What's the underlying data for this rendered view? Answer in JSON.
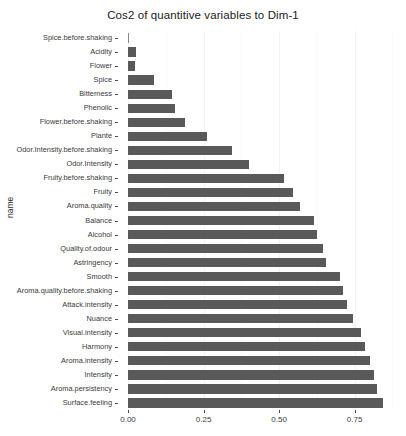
{
  "chart_data": {
    "type": "bar",
    "orientation": "horizontal",
    "title": "Cos2 of quantitive variables to Dim-1",
    "xlabel": "",
    "ylabel": "name",
    "xlim": [
      0,
      0.9
    ],
    "grid": true,
    "legend": "none",
    "bar_color": "#595959",
    "xticks": [
      {
        "value": 0,
        "label": "0.00"
      },
      {
        "value": 0.25,
        "label": "0.25"
      },
      {
        "value": 0.5,
        "label": "0.50"
      },
      {
        "value": 0.75,
        "label": "0.75"
      }
    ],
    "categories": [
      "Spice.before.shaking",
      "Acidity",
      "Flower",
      "Spice",
      "Bitterness",
      "Phenolic",
      "Flower.before.shaking",
      "Plante",
      "Odor.Intensity.before.shaking",
      "Odor.Intensity",
      "Fruity.before.shaking",
      "Fruity",
      "Aroma.quality",
      "Balance",
      "Alcohol",
      "Quality.of.odour",
      "Astringency",
      "Smooth",
      "Aroma.quality.before.shaking",
      "Attack.intensity",
      "Nuance",
      "Visual.intensity",
      "Harmony",
      "Aroma.intensity",
      "Intensity",
      "Aroma.persistency",
      "Surface.feeling"
    ],
    "values": [
      0.001,
      0.025,
      0.023,
      0.085,
      0.145,
      0.155,
      0.19,
      0.26,
      0.345,
      0.4,
      0.515,
      0.545,
      0.57,
      0.615,
      0.625,
      0.645,
      0.655,
      0.7,
      0.71,
      0.725,
      0.745,
      0.77,
      0.785,
      0.8,
      0.815,
      0.825,
      0.845
    ]
  }
}
